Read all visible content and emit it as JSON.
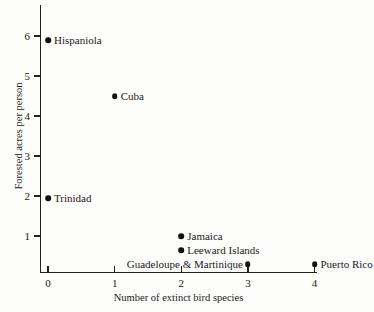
{
  "chart_data": {
    "type": "scatter",
    "title": "",
    "xlabel": "Number of extinct bird species",
    "ylabel": "Forested acres per person",
    "xlim": [
      0,
      4
    ],
    "ylim": [
      0,
      6.4
    ],
    "xticks": [
      "0",
      "1",
      "2",
      "3",
      "4"
    ],
    "yticks": [
      "1",
      "2",
      "3",
      "4",
      "5",
      "6"
    ],
    "grid": false,
    "legend": "none",
    "marker_color": "#111111",
    "axis_color": "#23201c",
    "background_color": "#fdfdfb",
    "points": [
      {
        "label": "Hispaniola",
        "x": 0,
        "y": 5.9,
        "label_side": "right"
      },
      {
        "label": "Cuba",
        "x": 1,
        "y": 4.5,
        "label_side": "right"
      },
      {
        "label": "Trinidad",
        "x": 0,
        "y": 1.95,
        "label_side": "right"
      },
      {
        "label": "Jamaica",
        "x": 2,
        "y": 1.0,
        "label_side": "right"
      },
      {
        "label": "Leeward Islands",
        "x": 2,
        "y": 0.65,
        "label_side": "right"
      },
      {
        "label": "Guadeloupe & Martinique",
        "x": 3,
        "y": 0.3,
        "label_side": "left"
      },
      {
        "label": "Puerto Rico",
        "x": 4,
        "y": 0.3,
        "label_side": "right"
      }
    ]
  }
}
